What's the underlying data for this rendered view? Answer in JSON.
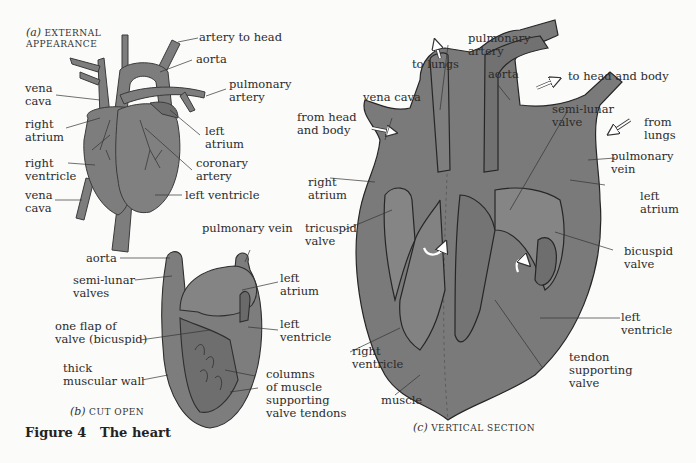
{
  "figure": {
    "number_label": "Figure 4",
    "title": "The heart"
  },
  "colors": {
    "tissue": "#7d7d7d",
    "tissue_dark": "#6a6a6a",
    "outline": "#2e2e2e",
    "background": "#fbfbfa",
    "text": "#2b2b2b"
  },
  "panel_a": {
    "caption_letter": "(a)",
    "caption_text": "EXTERNAL\nAPPEARANCE",
    "labels": {
      "artery_to_head": "artery to head",
      "aorta": "aorta",
      "pulmonary_artery": "pulmonary\nartery",
      "vena_cava_top": "vena\ncava",
      "right_atrium": "right\natrium",
      "left_atrium": "left\natrium",
      "coronary_artery": "coronary\nartery",
      "right_ventricle": "right\nventricle",
      "vena_cava_bottom": "vena\ncava",
      "left_ventricle": "left ventricle"
    }
  },
  "panel_b": {
    "caption_letter": "(b)",
    "caption_text": "CUT OPEN",
    "labels": {
      "pulmonary_vein": "pulmonary vein",
      "aorta": "aorta",
      "semi_lunar_valves": "semi-lunar\nvalves",
      "left_atrium": "left\natrium",
      "one_flap": "one flap of\nvalve (bicuspid)",
      "left_ventricle": "left\nventricle",
      "thick_wall": "thick\nmuscular wall",
      "columns": "columns\nof muscle\nsupporting\nvalve tendons"
    }
  },
  "panel_c": {
    "caption_letter": "(c)",
    "caption_text": "VERTICAL SECTION",
    "labels": {
      "pulmonary_artery": "pulmonary\nartery",
      "to_lungs": "to lungs",
      "aorta": "aorta",
      "to_head_and_body": "to head and body",
      "vena_cava": "vena cava",
      "from_head_and_body": "from head\nand body",
      "semi_lunar_valve": "semi-lunar\nvalve",
      "from_lungs": "from\nlungs",
      "pulmonary_vein": "pulmonary\nvein",
      "right_atrium": "right\natrium",
      "left_atrium": "left\natrium",
      "tricuspid_valve": "tricuspid\nvalve",
      "bicuspid_valve": "bicuspid\nvalve",
      "left_ventricle": "left\nventricle",
      "right_ventricle": "right\nventricle",
      "tendon_supporting_valve": "tendon\nsupporting\nvalve",
      "muscle": "muscle"
    }
  }
}
